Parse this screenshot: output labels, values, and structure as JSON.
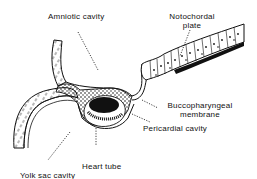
{
  "figure": {
    "labels": {
      "amniotic_cavity": "Amniotic cavity",
      "notochordal_plate_line1": "Notochordal",
      "notochordal_plate_line2": "plate",
      "buccopharyngeal_line1": "Buccopharyngeal",
      "buccopharyngeal_line2": "membrane",
      "pericardial_cavity": "Pericardial cavity",
      "heart_tube": "Heart tube",
      "yolk_sac_cavity": "Yolk sac cavity"
    },
    "colors": {
      "ink": "#111111",
      "background": "#ffffff"
    }
  }
}
